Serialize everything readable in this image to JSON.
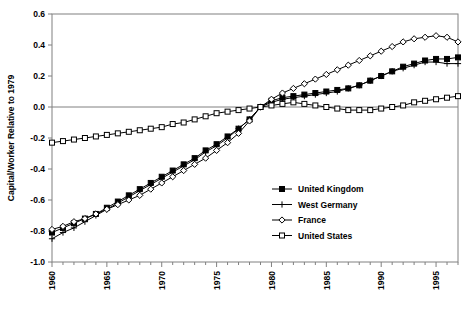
{
  "chart_data": {
    "type": "line",
    "title": "",
    "xlabel": "",
    "ylabel": "Capital/Worker Relative to 1979",
    "xlim": [
      1960,
      1997
    ],
    "ylim": [
      -1.0,
      0.6
    ],
    "yticks": [
      0.6,
      0.4,
      0.2,
      0.0,
      -0.2,
      -0.4,
      -0.6,
      -0.8,
      -1.0
    ],
    "ytick_labels": [
      "0.6",
      "0.4",
      "0.2",
      "0.0",
      "-0.2",
      "-0.4",
      "-0.6",
      "-0.8",
      "-1.0"
    ],
    "xticks": [
      1960,
      1965,
      1970,
      1975,
      1980,
      1985,
      1990,
      1995
    ],
    "xtick_labels": [
      "1960",
      "1965",
      "1970",
      "1975",
      "1980",
      "1985",
      "1990",
      "1995"
    ],
    "xtick_minor_interval": 1,
    "grid": false,
    "zero_reference_line": 0.0,
    "legend_position": "center-right",
    "x": [
      1960,
      1961,
      1962,
      1963,
      1964,
      1965,
      1966,
      1967,
      1968,
      1969,
      1970,
      1971,
      1972,
      1973,
      1974,
      1975,
      1976,
      1977,
      1978,
      1979,
      1980,
      1981,
      1982,
      1983,
      1984,
      1985,
      1986,
      1987,
      1988,
      1989,
      1990,
      1991,
      1992,
      1993,
      1994,
      1995,
      1996,
      1997
    ],
    "series": [
      {
        "name": "United Kingdom",
        "marker": "filled-square",
        "values": [
          -0.81,
          -0.78,
          -0.75,
          -0.72,
          -0.69,
          -0.65,
          -0.61,
          -0.57,
          -0.53,
          -0.49,
          -0.45,
          -0.41,
          -0.37,
          -0.33,
          -0.28,
          -0.24,
          -0.19,
          -0.14,
          -0.08,
          0.0,
          0.04,
          0.06,
          0.07,
          0.08,
          0.09,
          0.1,
          0.11,
          0.12,
          0.14,
          0.17,
          0.2,
          0.23,
          0.26,
          0.28,
          0.3,
          0.31,
          0.31,
          0.32
        ]
      },
      {
        "name": "West Germany",
        "marker": "plus",
        "values": [
          -0.85,
          -0.81,
          -0.78,
          -0.74,
          -0.7,
          -0.66,
          -0.62,
          -0.58,
          -0.54,
          -0.5,
          -0.46,
          -0.42,
          -0.38,
          -0.34,
          -0.29,
          -0.25,
          -0.2,
          -0.14,
          -0.08,
          0.0,
          0.03,
          0.05,
          0.06,
          0.07,
          0.08,
          0.09,
          0.1,
          0.12,
          0.14,
          0.17,
          0.2,
          0.23,
          0.25,
          0.27,
          0.29,
          0.29,
          0.28,
          0.28
        ]
      },
      {
        "name": "France",
        "marker": "open-diamond",
        "values": [
          -0.79,
          -0.77,
          -0.74,
          -0.72,
          -0.69,
          -0.66,
          -0.63,
          -0.6,
          -0.57,
          -0.53,
          -0.49,
          -0.45,
          -0.41,
          -0.37,
          -0.33,
          -0.28,
          -0.23,
          -0.17,
          -0.09,
          0.0,
          0.05,
          0.09,
          0.12,
          0.15,
          0.18,
          0.21,
          0.24,
          0.27,
          0.3,
          0.33,
          0.36,
          0.39,
          0.42,
          0.44,
          0.45,
          0.46,
          0.45,
          0.42
        ]
      },
      {
        "name": "United States",
        "marker": "open-square",
        "values": [
          -0.23,
          -0.22,
          -0.21,
          -0.2,
          -0.19,
          -0.18,
          -0.17,
          -0.16,
          -0.15,
          -0.14,
          -0.13,
          -0.11,
          -0.1,
          -0.08,
          -0.06,
          -0.04,
          -0.03,
          -0.02,
          -0.01,
          0.0,
          0.01,
          0.02,
          0.03,
          0.02,
          0.01,
          0.0,
          -0.01,
          -0.02,
          -0.02,
          -0.02,
          -0.01,
          0.0,
          0.01,
          0.03,
          0.04,
          0.05,
          0.06,
          0.07
        ]
      }
    ]
  },
  "legend": {
    "items": [
      {
        "label": "United Kingdom"
      },
      {
        "label": "West Germany"
      },
      {
        "label": "France"
      },
      {
        "label": "United States"
      }
    ]
  }
}
